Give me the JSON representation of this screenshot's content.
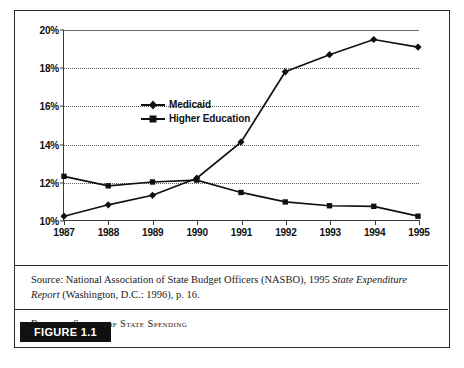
{
  "figure": {
    "tag": "FIGURE 1.1",
    "caption": "Relative Shares of State Spending",
    "source_line_1_plain": "Source: National Association of State Budget Officers (NASBO), 1995 ",
    "source_line_1_italic": "State Expenditure Report",
    "source_line_2": "(Washington, D.C.: 1996), p. 16."
  },
  "chart_data": {
    "type": "line",
    "title": "Relative Shares of State Spending",
    "xlabel": "",
    "ylabel": "",
    "categories": [
      "1987",
      "1988",
      "1989",
      "1990",
      "1991",
      "1992",
      "1993",
      "1994",
      "1995"
    ],
    "x": [
      1987,
      1988,
      1989,
      1990,
      1991,
      1992,
      1993,
      1994,
      1995
    ],
    "ylim": [
      10,
      20
    ],
    "yticks": [
      10,
      12,
      14,
      16,
      18,
      20
    ],
    "ytick_labels": [
      "10%",
      "12%",
      "14%",
      "16%",
      "18%",
      "20%"
    ],
    "grid": true,
    "legend_position": "upper-left-inside",
    "series": [
      {
        "name": "Medicaid",
        "marker": "diamond",
        "color": "#111111",
        "values": [
          10.2,
          10.8,
          11.3,
          12.2,
          14.1,
          17.8,
          18.7,
          19.5,
          19.1
        ]
      },
      {
        "name": "Higher Education",
        "marker": "square",
        "color": "#111111",
        "values": [
          12.3,
          11.8,
          12.0,
          12.1,
          11.45,
          10.95,
          10.75,
          10.72,
          10.2
        ]
      }
    ]
  }
}
